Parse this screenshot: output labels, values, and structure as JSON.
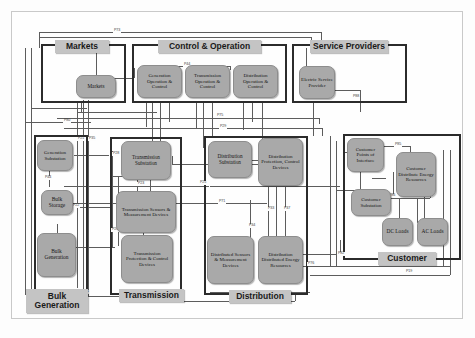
{
  "diagram": {
    "colors": {
      "node_fill": "#a9a9a9",
      "banner_fill": "#c4c4c4",
      "domain_border": "#2b2b2b",
      "line": "#5c5c5c",
      "background": "#fdfdfd"
    }
  },
  "domains": [
    {
      "id": "markets",
      "banner": "Markets",
      "nodes": [
        {
          "id": "markets-node",
          "label": "Markets"
        }
      ]
    },
    {
      "id": "control-operation",
      "banner": "Control & Operation",
      "nodes": [
        {
          "id": "generation-op",
          "label": "Generation Operation & Control"
        },
        {
          "id": "transmission-op",
          "label": "Transmission Operation & Control"
        },
        {
          "id": "distribution-op",
          "label": "Distribution Operation & Control"
        }
      ]
    },
    {
      "id": "service-providers",
      "banner": "Service Providers",
      "nodes": [
        {
          "id": "electric-service-provider",
          "label": "Electric Service Provider"
        }
      ]
    },
    {
      "id": "bulk-generation",
      "banner": "Bulk Generation",
      "nodes": [
        {
          "id": "generation-substation",
          "label": "Generation Substation"
        },
        {
          "id": "bulk-storage",
          "label": "Bulk Storage"
        },
        {
          "id": "bulk-generation-node",
          "label": "Bulk Generation"
        }
      ]
    },
    {
      "id": "transmission",
      "banner": "Transmission",
      "nodes": [
        {
          "id": "transmission-substation",
          "label": "Transmission Substation"
        },
        {
          "id": "transmission-sensors",
          "label": "Transmission Sensors & Measurement Devices"
        },
        {
          "id": "transmission-protection",
          "label": "Transmission Protection & Control Devices"
        }
      ]
    },
    {
      "id": "distribution",
      "banner": "Distribution",
      "nodes": [
        {
          "id": "distribution-substation",
          "label": "Distribution Substation"
        },
        {
          "id": "distribution-protection",
          "label": "Distribution Protection, Control Devices"
        },
        {
          "id": "distributed-sensors",
          "label": "Distributed Sensors & Measurement Devices"
        },
        {
          "id": "distribution-der",
          "label": "Distribution Distributed Energy Resources"
        }
      ]
    },
    {
      "id": "customer",
      "banner": "Customer",
      "nodes": [
        {
          "id": "customer-poi",
          "label": "Customer Points of Interface"
        },
        {
          "id": "customer-der",
          "label": "Customer Distribute Energy Resources"
        },
        {
          "id": "customer-substation",
          "label": "Customer Substation"
        },
        {
          "id": "dc-loads",
          "label": "DC Loads"
        },
        {
          "id": "ac-loads",
          "label": "AC Loads"
        }
      ]
    }
  ],
  "interface_labels": [
    {
      "id": "p73",
      "text": "P73"
    },
    {
      "id": "p44",
      "text": "P44"
    },
    {
      "id": "p75",
      "text": "P75"
    },
    {
      "id": "p29",
      "text": "P29"
    },
    {
      "id": "p80",
      "text": "P80"
    },
    {
      "id": "p21",
      "text": "P21"
    },
    {
      "id": "p35",
      "text": "P35"
    },
    {
      "id": "p28",
      "text": "P28"
    },
    {
      "id": "p44b",
      "text": "P44"
    },
    {
      "id": "p23",
      "text": "P23"
    },
    {
      "id": "p22",
      "text": "P22"
    },
    {
      "id": "p26",
      "text": "P26"
    },
    {
      "id": "p11",
      "text": "P11"
    },
    {
      "id": "p25",
      "text": "P25"
    },
    {
      "id": "p71",
      "text": "P71"
    },
    {
      "id": "p33",
      "text": "P33"
    },
    {
      "id": "p37",
      "text": "P37"
    },
    {
      "id": "p34",
      "text": "P34"
    },
    {
      "id": "p76",
      "text": "P76"
    },
    {
      "id": "p88",
      "text": "P88"
    },
    {
      "id": "p82",
      "text": "P82"
    },
    {
      "id": "p85",
      "text": "P85"
    },
    {
      "id": "p86",
      "text": "P86"
    },
    {
      "id": "p90",
      "text": "P90"
    },
    {
      "id": "p19",
      "text": "P19"
    }
  ]
}
